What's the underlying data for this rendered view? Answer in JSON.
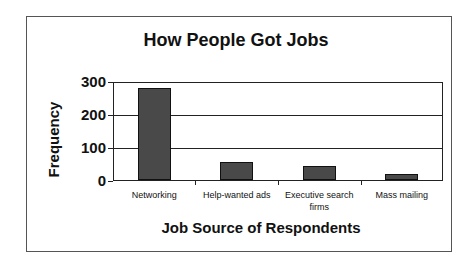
{
  "chart_data": {
    "type": "bar",
    "title": "How People Got Jobs",
    "xlabel": "Job Source of Respondents",
    "ylabel": "Frequency",
    "categories": [
      "Networking",
      "Help-wanted ads",
      "Executive search firms",
      "Mass mailing"
    ],
    "values": [
      280,
      55,
      42,
      18
    ],
    "ylim": [
      0,
      300
    ],
    "yticks": [
      "0",
      "100",
      "200",
      "300"
    ],
    "grid": true,
    "legend": null,
    "bar_color": "#888888"
  }
}
